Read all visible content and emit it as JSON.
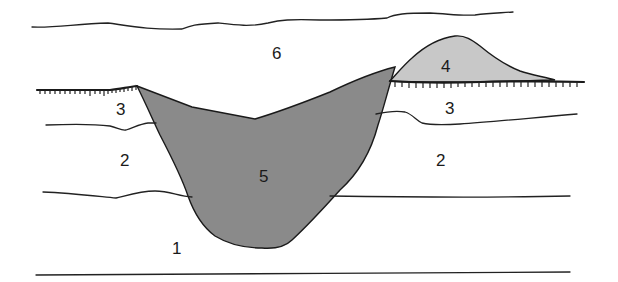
{
  "figure": {
    "type": "geological cross-section",
    "colors": {
      "background": "#ffffff",
      "line": "#222222",
      "unit_5_fill": "#8a8a8a",
      "unit_4_fill": "#c8c8c8"
    },
    "units": [
      {
        "id": "unit-1",
        "label": "1"
      },
      {
        "id": "unit-2-left",
        "label": "2"
      },
      {
        "id": "unit-2-right",
        "label": "2"
      },
      {
        "id": "unit-3-left",
        "label": "3"
      },
      {
        "id": "unit-3-right",
        "label": "3"
      },
      {
        "id": "unit-4",
        "label": "4"
      },
      {
        "id": "unit-5",
        "label": "5"
      },
      {
        "id": "unit-6",
        "label": "6"
      }
    ]
  }
}
